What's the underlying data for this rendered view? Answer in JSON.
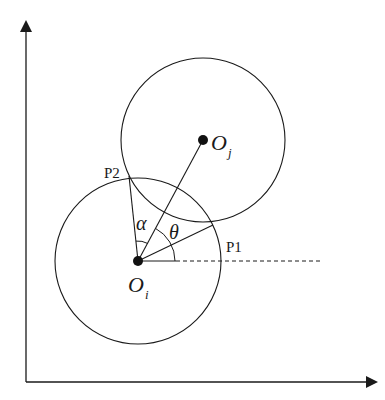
{
  "diagram": {
    "type": "geometry",
    "axes": {
      "x_axis": true,
      "y_axis": true,
      "arrows": true
    },
    "circles": [
      {
        "id": "circle-i",
        "center_label": "O",
        "center_sub": "i",
        "cx": 138,
        "cy": 261,
        "r": 83
      },
      {
        "id": "circle-j",
        "center_label": "O",
        "center_sub": "j",
        "cx": 203,
        "cy": 140,
        "r": 82
      }
    ],
    "points": {
      "p1": {
        "label": "P1",
        "x": 213,
        "y": 225
      },
      "p2": {
        "label": "P2",
        "x": 129,
        "y": 176
      }
    },
    "angles": {
      "alpha": {
        "label": "α"
      },
      "theta": {
        "label": "θ"
      }
    },
    "colors": {
      "stroke": "#1a1a1a",
      "background": "#ffffff"
    }
  }
}
